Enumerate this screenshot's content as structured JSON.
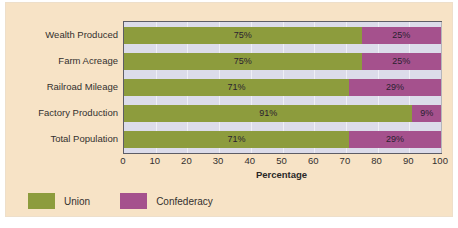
{
  "chart_data": {
    "type": "bar",
    "orientation": "horizontal",
    "stacked": true,
    "title": "",
    "xlabel": "Percentage",
    "ylabel": "",
    "xlim": [
      0,
      100
    ],
    "xticks": [
      0,
      10,
      20,
      30,
      40,
      50,
      60,
      70,
      80,
      90,
      100
    ],
    "xtick_labels": [
      "0",
      "10",
      "20",
      "30",
      "40",
      "50",
      "60",
      "70",
      "80",
      "90",
      "100"
    ],
    "grid": true,
    "legend_position": "bottom-left",
    "categories": [
      "Wealth Produced",
      "Farm Acreage",
      "Railroad Mileage",
      "Factory Production",
      "Total Population"
    ],
    "series": [
      {
        "name": "Union",
        "color": "#8d9c3d",
        "values": [
          75,
          75,
          71,
          91,
          71
        ],
        "value_labels": [
          "75%",
          "75%",
          "71%",
          "91%",
          "71%"
        ]
      },
      {
        "name": "Confederacy",
        "color": "#a5518d",
        "values": [
          25,
          25,
          29,
          9,
          29
        ],
        "value_labels": [
          "25%",
          "25%",
          "29%",
          "9%",
          "29%"
        ]
      }
    ]
  },
  "legend": {
    "items": [
      {
        "label": "Union",
        "color": "#8d9c3d"
      },
      {
        "label": "Confederacy",
        "color": "#a5518d"
      }
    ]
  },
  "colors": {
    "card_background": "#f7e3c6",
    "plot_background": "#dcdcea",
    "plot_border": "#5d5d66",
    "union": "#8d9c3d",
    "confederacy": "#a5518d",
    "text": "#33302e"
  }
}
